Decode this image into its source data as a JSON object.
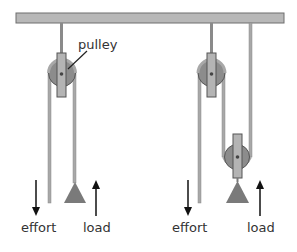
{
  "diagram": {
    "labels": {
      "pulley": "pulley",
      "left_effort": "effort",
      "left_load": "load",
      "right_effort": "effort",
      "right_load": "load"
    },
    "colors": {
      "beam_fill": "#b8b8b8",
      "beam_stroke": "#6e6e6e",
      "rope": "#a8a8a8",
      "rope_stroke": "#7a7a7a",
      "pulley_wheel": "#8c8c8c",
      "pulley_bracket": "#b4b4b4",
      "load": "#7a7a7a",
      "arrow": "#111111",
      "text": "#333333"
    }
  }
}
